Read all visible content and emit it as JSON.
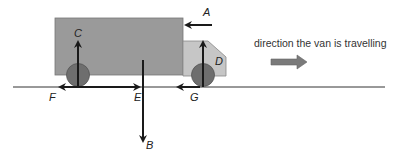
{
  "diagram": {
    "caption": "direction the van is travelling",
    "labels": {
      "A": "A",
      "B": "B",
      "C": "C",
      "D": "D",
      "E": "E",
      "F": "F",
      "G": "G"
    },
    "colors": {
      "body": "#9a9a9a",
      "cab": "#c6c6c6",
      "wheel": "#6e6e6e",
      "arrow": "#1a1a1a",
      "direction_arrow": "#7a7a7a",
      "ground": "#333333"
    }
  }
}
